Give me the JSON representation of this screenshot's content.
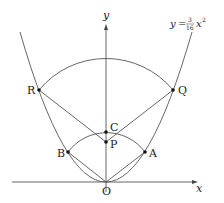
{
  "diagram": {
    "equation": {
      "lhs": "y",
      "eq": "=",
      "num": "3",
      "den": "16",
      "var": "x",
      "exp": "2"
    },
    "axes": {
      "x_label": "x",
      "y_label": "y",
      "origin_label": "O"
    },
    "points": {
      "A": "A",
      "B": "B",
      "C": "C",
      "P": "P",
      "Q": "Q",
      "R": "R"
    },
    "colors": {
      "line": "#555555",
      "point": "#111111",
      "text": "#222222"
    }
  }
}
